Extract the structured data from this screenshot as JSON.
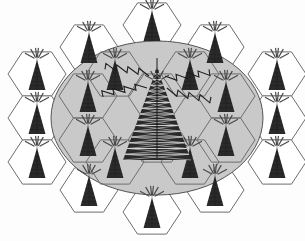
{
  "figure": {
    "title": "Cellular network hexagonal cell layout with central base station",
    "background_color": "#ffffff"
  },
  "colors": {
    "cell_fill_outside": "#ffffff",
    "cell_stroke": "#6e6e6e",
    "cell_stroke_dark": "#2b2b2b",
    "coverage_fill": "#c9c9c9",
    "coverage_stroke": "#555555",
    "tower_color": "#2a2a2a",
    "antenna_color": "#4a4a4a",
    "bolt_color": "#1e1e1e"
  },
  "coverage_area": {
    "name": "coverage-ellipse",
    "shape": "ellipse",
    "cx": 157,
    "cy": 118,
    "rx": 106,
    "ry": 77
  },
  "geometry": {
    "hex_radius": 29,
    "hex_width": 50,
    "row_step": 43.5,
    "note": "flat-top hexagons, offset rows"
  },
  "central_station": {
    "name": "central-base-station",
    "cx": 157,
    "cy": 118,
    "tower_height": 92,
    "tower_half_base": 34,
    "label": "central transmitter"
  },
  "signal_bolts": {
    "count": 4,
    "name": "lightning-bolt",
    "directions": [
      "upper-left",
      "upper-right",
      "left",
      "right"
    ]
  },
  "cells": [
    {
      "id": "c01",
      "cx": 152,
      "cy": 25,
      "inside": false
    },
    {
      "id": "c02",
      "cx": 89,
      "cy": 47,
      "inside": false
    },
    {
      "id": "c03",
      "cx": 215,
      "cy": 47,
      "inside": false
    },
    {
      "id": "c04",
      "cx": 37,
      "cy": 74,
      "inside": false
    },
    {
      "id": "c05",
      "cx": 277,
      "cy": 74,
      "inside": false
    },
    {
      "id": "c06",
      "cx": 115,
      "cy": 74,
      "inside": true
    },
    {
      "id": "c07",
      "cx": 190,
      "cy": 74,
      "inside": true
    },
    {
      "id": "c08",
      "cx": 37,
      "cy": 118,
      "inside": false
    },
    {
      "id": "c09",
      "cx": 277,
      "cy": 118,
      "inside": false
    },
    {
      "id": "c10",
      "cx": 88,
      "cy": 96,
      "inside": true
    },
    {
      "id": "c11",
      "cx": 226,
      "cy": 96,
      "inside": true
    },
    {
      "id": "c12",
      "cx": 88,
      "cy": 140,
      "inside": true
    },
    {
      "id": "c13",
      "cx": 226,
      "cy": 140,
      "inside": true
    },
    {
      "id": "c14",
      "cx": 157,
      "cy": 96,
      "inside": true
    },
    {
      "id": "c15",
      "cx": 115,
      "cy": 162,
      "inside": true
    },
    {
      "id": "c16",
      "cx": 190,
      "cy": 162,
      "inside": true
    },
    {
      "id": "c17",
      "cx": 37,
      "cy": 162,
      "inside": false
    },
    {
      "id": "c18",
      "cx": 277,
      "cy": 162,
      "inside": false
    },
    {
      "id": "c19",
      "cx": 89,
      "cy": 190,
      "inside": false
    },
    {
      "id": "c20",
      "cx": 215,
      "cy": 190,
      "inside": false
    },
    {
      "id": "c21",
      "cx": 152,
      "cy": 212,
      "inside": false
    },
    {
      "id": "c22",
      "cx": 157,
      "cy": 140,
      "inside": true
    }
  ],
  "antennas": {
    "per_cell": 6,
    "name": "antenna-dash",
    "dash_length": 13
  }
}
